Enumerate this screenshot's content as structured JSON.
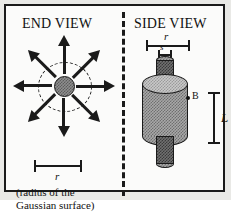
{
  "figure": {
    "panels": [
      {
        "id": "end-view",
        "title": "END VIEW",
        "dimension_label": "r",
        "caption_line1": "(radius of the",
        "caption_line2": "Gaussian surface)",
        "arrow_count": 8,
        "center_shape": "hatched-circle",
        "dashed_boundary": "circle"
      },
      {
        "id": "side-view",
        "title": "SIDE VIEW",
        "radius_label": "r",
        "shaft_label": "s",
        "field_label": "B",
        "length_label": "L",
        "body_shape": "hatched-cylinder"
      }
    ],
    "divider": "vertical-dashed",
    "colors": {
      "ink": "#1a1a1a",
      "paper": "#fbfbfa",
      "page": "#e9e9e6",
      "hatch_dark": "#707070",
      "hatch_mid": "#a8a8a8",
      "hatch_light": "#c9c9c9"
    }
  }
}
